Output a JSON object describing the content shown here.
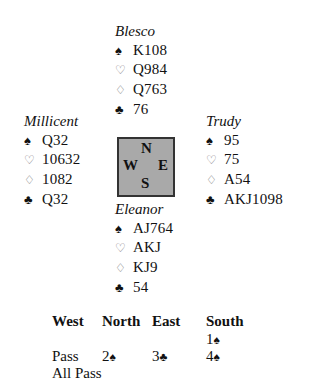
{
  "hands": {
    "north": {
      "name": "Blesco",
      "spades": "K108",
      "hearts": "Q984",
      "diamonds": "Q763",
      "clubs": "76"
    },
    "west": {
      "name": "Millicent",
      "spades": "Q32",
      "hearts": "10632",
      "diamonds": "1082",
      "clubs": "Q32"
    },
    "east": {
      "name": "Trudy",
      "spades": "95",
      "hearts": "75",
      "diamonds": "A54",
      "clubs": "AKJ1098"
    },
    "south": {
      "name": "Eleanor",
      "spades": "AJ764",
      "hearts": "AKJ",
      "diamonds": "KJ9",
      "clubs": "54"
    }
  },
  "suit_icons": {
    "spades": "♠",
    "hearts": "♡",
    "diamonds": "♢",
    "clubs": "♣"
  },
  "compass": {
    "n": "N",
    "w": "W",
    "e": "E",
    "s": "S"
  },
  "auction": {
    "headers": [
      "West",
      "North",
      "East",
      "South"
    ],
    "rows": [
      [
        {
          "level": "",
          "suit": ""
        },
        {
          "level": "",
          "suit": ""
        },
        {
          "level": "",
          "suit": ""
        },
        {
          "level": "1",
          "suit": "♠"
        }
      ],
      [
        {
          "level": "Pass",
          "suit": ""
        },
        {
          "level": "2",
          "suit": "♠"
        },
        {
          "level": "3",
          "suit": "♣"
        },
        {
          "level": "4",
          "suit": "♠"
        }
      ],
      [
        {
          "level": "All Pass",
          "suit": ""
        },
        {
          "level": "",
          "suit": ""
        },
        {
          "level": "",
          "suit": ""
        },
        {
          "level": "",
          "suit": ""
        }
      ]
    ]
  },
  "colors": {
    "compass_fill": "#a9a9a9",
    "compass_border": "#333333",
    "outline_suit": "#777777"
  }
}
